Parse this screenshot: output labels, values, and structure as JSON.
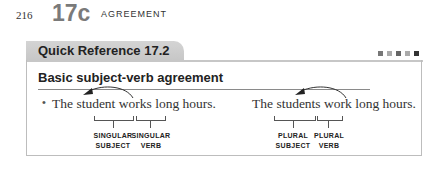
{
  "page": {
    "number": "216",
    "section": "17c",
    "running_head": "AGREEMENT"
  },
  "box": {
    "tab_title": "Quick Reference 17.2",
    "heading": "Basic subject-verb agreement",
    "dot_colors": [
      "#777777",
      "#aaaaaa",
      "#666666",
      "#aaaaaa",
      "#333333"
    ]
  },
  "examples": [
    {
      "sentence_pre": "The ",
      "subject": "student",
      "verb": "works",
      "sentence_post": " long hours.",
      "subject_label": [
        "SINGULAR",
        "SUBJECT"
      ],
      "verb_label": [
        "SINGULAR",
        "VERB"
      ]
    },
    {
      "sentence_pre": "The ",
      "subject": "students",
      "verb": "work",
      "sentence_post": " long hours.",
      "subject_label": [
        "PLURAL",
        "SUBJECT"
      ],
      "verb_label": [
        "PLURAL",
        "VERB"
      ]
    }
  ]
}
